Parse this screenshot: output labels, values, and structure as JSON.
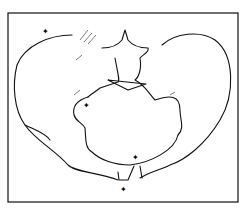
{
  "figure": {
    "markers": [
      {
        "name": "marker-iliac-crest",
        "symbol": "arrow"
      },
      {
        "name": "marker-sacroiliac",
        "symbol": "arrow"
      },
      {
        "name": "marker-pubic-top",
        "symbol": "arrow"
      },
      {
        "name": "marker-pubic-bottom",
        "symbol": "arrow"
      }
    ],
    "colors": {
      "line": "#111111",
      "frame": "#111111",
      "background": "#ffffff"
    }
  }
}
